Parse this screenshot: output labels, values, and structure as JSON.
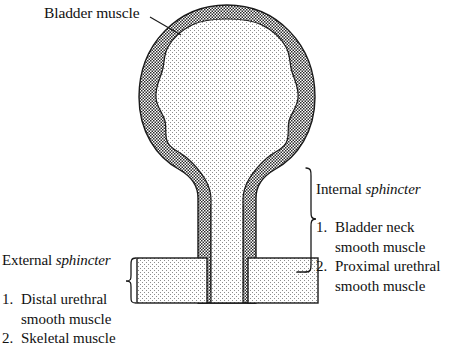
{
  "figure": {
    "title_label": "Bladder muscle",
    "caption_absent": true,
    "colors": {
      "ink": "#111111",
      "wall_fill": "#9a9a9a",
      "lumen_fill": "#f2f2f2",
      "sphincter_fill": "#ececec",
      "outline": "#1a1a1a",
      "background": "#ffffff"
    },
    "annotations": {
      "bladder_muscle": {
        "text": "Bladder muscle",
        "leader_from": [
          152,
          18
        ],
        "leader_to": [
          181,
          34
        ]
      }
    },
    "regions": [
      {
        "name": "bladder-dome",
        "description": "Round bladder body with thick stippled muscular wall and light stippled lumen",
        "center": [
          227,
          97
        ],
        "radius": 88
      },
      {
        "name": "urethra",
        "description": "Vertical tube descending from bladder neck, two stippled walls with light lumen",
        "x_center": 227,
        "top": 168,
        "bottom": 303
      },
      {
        "name": "external-sphincter-left-box",
        "rect": [
          137,
          258,
          70,
          45
        ]
      },
      {
        "name": "external-sphincter-right-box",
        "rect": [
          248,
          258,
          70,
          45
        ]
      }
    ],
    "braces": {
      "internal": {
        "x": 312,
        "top": 168,
        "bottom": 272,
        "tip_y": 219,
        "direction": "left"
      },
      "external": {
        "x": 128,
        "top": 258,
        "bottom": 303,
        "tip_y": 280,
        "direction": "right"
      }
    }
  },
  "labels": {
    "internal_sphincter": {
      "word1": "Internal",
      "word2": "sphincter"
    },
    "external_sphincter": {
      "word1": "External",
      "word2": "sphincter"
    }
  },
  "internal_sphincter_list": [
    {
      "num": "1.",
      "line1": "Bladder neck",
      "line2": "smooth muscle"
    },
    {
      "num": "2.",
      "line1": "Proximal urethral",
      "line2": "smooth muscle"
    }
  ],
  "external_sphincter_list": [
    {
      "num": "1.",
      "line1": "Distal urethral",
      "line2": "smooth muscle"
    },
    {
      "num": "2.",
      "line1": "Skeletal muscle",
      "line2": ""
    }
  ]
}
